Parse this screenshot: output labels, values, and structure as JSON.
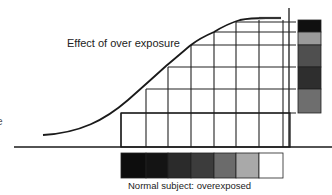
{
  "labels": {
    "curve_annotation": "Effect of over exposure",
    "caption": "Normal subject: overexposed",
    "left_edge_fragment": "e"
  },
  "bottom_tone_strip": {
    "colors": [
      "#0d0d0d",
      "#141414",
      "#2b2b2b",
      "#3c3c3c",
      "#6b6b6b",
      "#a9a9a9",
      "#ffffff"
    ]
  },
  "right_tone_strip": {
    "colors": [
      "#101010",
      "#9a9a9a",
      "#4f4f4f",
      "#2e2e2e",
      "#6e6e6e"
    ]
  },
  "colors": {
    "line": "#1a1a1a",
    "grid": "#222222",
    "background": "#ffffff"
  }
}
